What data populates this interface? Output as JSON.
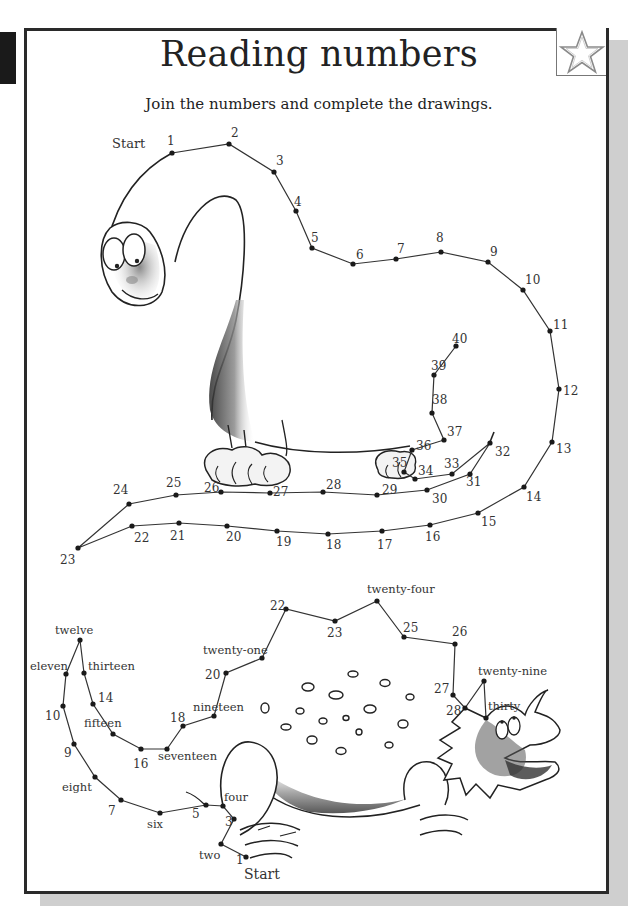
{
  "page": {
    "title": "Reading numbers",
    "instruction": "Join the numbers and complete the drawings.",
    "badge_icon": "star-outline-icon"
  },
  "brachiosaurus": {
    "start_label": "Start",
    "dots": [
      {
        "n": "1",
        "x": 172,
        "y": 153,
        "lx": 167,
        "ly": 145
      },
      {
        "n": "2",
        "x": 229,
        "y": 144,
        "lx": 231,
        "ly": 137
      },
      {
        "n": "3",
        "x": 274,
        "y": 172,
        "lx": 276,
        "ly": 165
      },
      {
        "n": "4",
        "x": 296,
        "y": 211,
        "lx": 294,
        "ly": 206
      },
      {
        "n": "5",
        "x": 312,
        "y": 248,
        "lx": 311,
        "ly": 242
      },
      {
        "n": "6",
        "x": 353,
        "y": 264,
        "lx": 356,
        "ly": 259
      },
      {
        "n": "7",
        "x": 396,
        "y": 259,
        "lx": 397,
        "ly": 253
      },
      {
        "n": "8",
        "x": 441,
        "y": 252,
        "lx": 436,
        "ly": 242
      },
      {
        "n": "9",
        "x": 488,
        "y": 262,
        "lx": 490,
        "ly": 256
      },
      {
        "n": "10",
        "x": 523,
        "y": 290,
        "lx": 525,
        "ly": 284
      },
      {
        "n": "11",
        "x": 550,
        "y": 331,
        "lx": 553,
        "ly": 329
      },
      {
        "n": "12",
        "x": 559,
        "y": 389,
        "lx": 563,
        "ly": 395
      },
      {
        "n": "13",
        "x": 552,
        "y": 442,
        "lx": 556,
        "ly": 453
      },
      {
        "n": "14",
        "x": 524,
        "y": 487,
        "lx": 526,
        "ly": 501
      },
      {
        "n": "15",
        "x": 478,
        "y": 513,
        "lx": 481,
        "ly": 526
      },
      {
        "n": "16",
        "x": 430,
        "y": 525,
        "lx": 425,
        "ly": 541
      },
      {
        "n": "17",
        "x": 382,
        "y": 531,
        "lx": 377,
        "ly": 549
      },
      {
        "n": "18",
        "x": 328,
        "y": 534,
        "lx": 326,
        "ly": 549
      },
      {
        "n": "19",
        "x": 277,
        "y": 531,
        "lx": 276,
        "ly": 546
      },
      {
        "n": "20",
        "x": 227,
        "y": 526,
        "lx": 226,
        "ly": 541
      },
      {
        "n": "21",
        "x": 179,
        "y": 523,
        "lx": 170,
        "ly": 540
      },
      {
        "n": "22",
        "x": 132,
        "y": 526,
        "lx": 134,
        "ly": 542
      },
      {
        "n": "23",
        "x": 78,
        "y": 548,
        "lx": 60,
        "ly": 564
      },
      {
        "n": "24",
        "x": 129,
        "y": 504,
        "lx": 113,
        "ly": 494
      },
      {
        "n": "25",
        "x": 176,
        "y": 495,
        "lx": 166,
        "ly": 487
      },
      {
        "n": "26",
        "x": 221,
        "y": 492,
        "lx": 204,
        "ly": 492
      },
      {
        "n": "27",
        "x": 270,
        "y": 493,
        "lx": 273,
        "ly": 496
      },
      {
        "n": "28",
        "x": 323,
        "y": 492,
        "lx": 326,
        "ly": 489
      },
      {
        "n": "29",
        "x": 377,
        "y": 495,
        "lx": 382,
        "ly": 494
      },
      {
        "n": "30",
        "x": 427,
        "y": 490,
        "lx": 432,
        "ly": 503
      },
      {
        "n": "31",
        "x": 470,
        "y": 474,
        "lx": 466,
        "ly": 486
      },
      {
        "n": "32",
        "x": 490,
        "y": 443,
        "lx": 495,
        "ly": 456
      },
      {
        "n": "33",
        "x": 452,
        "y": 474,
        "lx": 444,
        "ly": 468
      },
      {
        "n": "34",
        "x": 415,
        "y": 479,
        "lx": 418,
        "ly": 475
      },
      {
        "n": "35",
        "x": 404,
        "y": 472,
        "lx": 392,
        "ly": 467
      },
      {
        "n": "36",
        "x": 412,
        "y": 450,
        "lx": 416,
        "ly": 450
      },
      {
        "n": "37",
        "x": 444,
        "y": 440,
        "lx": 447,
        "ly": 436
      },
      {
        "n": "38",
        "x": 432,
        "y": 413,
        "lx": 432,
        "ly": 404
      },
      {
        "n": "39",
        "x": 434,
        "y": 375,
        "lx": 431,
        "ly": 370
      },
      {
        "n": "40",
        "x": 456,
        "y": 346,
        "lx": 452,
        "ly": 343
      }
    ]
  },
  "stegosaurus": {
    "start_label": "Start",
    "dots": [
      {
        "n": "1",
        "x": 246,
        "y": 857,
        "lx": 236,
        "ly": 864
      },
      {
        "n": "two",
        "x": 221,
        "y": 844,
        "lx": 199,
        "ly": 859
      },
      {
        "n": "3",
        "x": 234,
        "y": 819,
        "lx": 225,
        "ly": 826
      },
      {
        "n": "four",
        "x": 223,
        "y": 806,
        "lx": 224,
        "ly": 801
      },
      {
        "n": "5",
        "x": 206,
        "y": 805,
        "lx": 192,
        "ly": 818
      },
      {
        "n": "six",
        "x": 160,
        "y": 813,
        "lx": 147,
        "ly": 828
      },
      {
        "n": "7",
        "x": 121,
        "y": 800,
        "lx": 108,
        "ly": 815
      },
      {
        "n": "eight",
        "x": 95,
        "y": 777,
        "lx": 62,
        "ly": 791
      },
      {
        "n": "9",
        "x": 74,
        "y": 744,
        "lx": 64,
        "ly": 757
      },
      {
        "n": "10",
        "x": 63,
        "y": 706,
        "lx": 45,
        "ly": 720
      },
      {
        "n": "eleven",
        "x": 66,
        "y": 674,
        "lx": 30,
        "ly": 670
      },
      {
        "n": "twelve",
        "x": 80,
        "y": 640,
        "lx": 55,
        "ly": 634
      },
      {
        "n": "thirteen",
        "x": 84,
        "y": 673,
        "lx": 88,
        "ly": 670
      },
      {
        "n": "14",
        "x": 93,
        "y": 704,
        "lx": 98,
        "ly": 702
      },
      {
        "n": "fifteen",
        "x": 113,
        "y": 734,
        "lx": 84,
        "ly": 727
      },
      {
        "n": "16",
        "x": 141,
        "y": 749,
        "lx": 133,
        "ly": 768
      },
      {
        "n": "seventeen",
        "x": 167,
        "y": 749,
        "lx": 158,
        "ly": 760
      },
      {
        "n": "18",
        "x": 183,
        "y": 726,
        "lx": 170,
        "ly": 722
      },
      {
        "n": "nineteen",
        "x": 214,
        "y": 716,
        "lx": 193,
        "ly": 711
      },
      {
        "n": "20",
        "x": 226,
        "y": 673,
        "lx": 205,
        "ly": 679
      },
      {
        "n": "twenty-one",
        "x": 262,
        "y": 658,
        "lx": 203,
        "ly": 654
      },
      {
        "n": "22",
        "x": 286,
        "y": 609,
        "lx": 270,
        "ly": 610
      },
      {
        "n": "23",
        "x": 335,
        "y": 621,
        "lx": 327,
        "ly": 637
      },
      {
        "n": "twenty-four",
        "x": 377,
        "y": 601,
        "lx": 367,
        "ly": 593
      },
      {
        "n": "25",
        "x": 404,
        "y": 637,
        "lx": 403,
        "ly": 632
      },
      {
        "n": "26",
        "x": 455,
        "y": 644,
        "lx": 452,
        "ly": 636
      },
      {
        "n": "27",
        "x": 453,
        "y": 695,
        "lx": 434,
        "ly": 693
      },
      {
        "n": "28",
        "x": 465,
        "y": 708,
        "lx": 446,
        "ly": 715
      },
      {
        "n": "twenty-nine",
        "x": 484,
        "y": 681,
        "lx": 478,
        "ly": 675
      },
      {
        "n": "thirty",
        "x": 486,
        "y": 718,
        "lx": 488,
        "ly": 710
      }
    ]
  }
}
